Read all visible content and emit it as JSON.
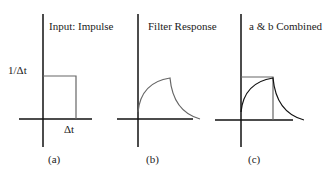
{
  "panels": [
    {
      "id": "a",
      "title": "Input: Impulse",
      "caption": "(a)",
      "y_label": "1/Δt",
      "x_label": "Δt"
    },
    {
      "id": "b",
      "title": "Filter Response",
      "caption": "(b)"
    },
    {
      "id": "c",
      "title": "a & b Combined",
      "caption": "(c)"
    }
  ],
  "colors": {
    "axis": "#111111",
    "curve": "#666666"
  }
}
